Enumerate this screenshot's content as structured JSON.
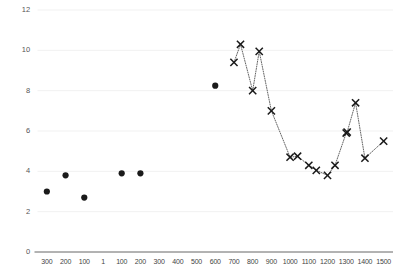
{
  "chart_data": {
    "type": "scatter",
    "title": "",
    "subtitle": "",
    "xlabel": "",
    "ylabel": "",
    "xlim": [
      0,
      19
    ],
    "ylim": [
      0,
      12
    ],
    "grid": true,
    "legend_position": "none",
    "y_ticks": [
      0,
      2,
      4,
      6,
      8,
      10,
      12
    ],
    "y_tick_labels": [
      "0",
      "2",
      "4",
      "6",
      "8",
      "10",
      "12"
    ],
    "x_tick_labels": [
      "300",
      "200",
      "100",
      "1",
      "100",
      "200",
      "300",
      "400",
      "500",
      "600",
      "700",
      "800",
      "900",
      "1000",
      "1100",
      "1200",
      "1300",
      "1400",
      "1500"
    ],
    "series": [
      {
        "name": "isolated-points",
        "marker": "filled-circle",
        "color": "#1a1a1a",
        "connected": false,
        "points": [
          {
            "x_label": "300",
            "x_index": 0,
            "value": 3.0
          },
          {
            "x_label": "200",
            "x_index": 1,
            "value": 3.8
          },
          {
            "x_label": "100",
            "x_index": 2,
            "value": 2.7
          },
          {
            "x_label": "100",
            "x_index": 4,
            "value": 3.9
          },
          {
            "x_label": "200",
            "x_index": 5,
            "value": 3.9
          },
          {
            "x_label": "600",
            "x_index": 9,
            "value": 8.25
          }
        ]
      },
      {
        "name": "connected-series",
        "marker": "x",
        "color": "#1a1a1a",
        "connected": true,
        "line_style": "dotted",
        "points": [
          {
            "x_label": "700",
            "x_index": 10,
            "value": 9.4
          },
          {
            "x_label": "700",
            "x_index": 10.35,
            "value": 10.3
          },
          {
            "x_label": "800",
            "x_index": 11,
            "value": 8.0
          },
          {
            "x_label": "800",
            "x_index": 11.35,
            "value": 9.95
          },
          {
            "x_label": "900",
            "x_index": 12,
            "value": 7.0
          },
          {
            "x_label": "1000",
            "x_index": 13,
            "value": 4.7
          },
          {
            "x_label": "1000",
            "x_index": 13.4,
            "value": 4.75
          },
          {
            "x_label": "1100",
            "x_index": 14,
            "value": 4.3
          },
          {
            "x_label": "1100",
            "x_index": 14.4,
            "value": 4.05
          },
          {
            "x_label": "1200",
            "x_index": 15,
            "value": 3.8
          },
          {
            "x_label": "1200",
            "x_index": 15.4,
            "value": 4.3
          },
          {
            "x_label": "1300",
            "x_index": 16,
            "value": 5.9
          },
          {
            "x_label": "1300",
            "x_index": 16.05,
            "value": 5.95
          },
          {
            "x_label": "1300",
            "x_index": 16.5,
            "value": 7.4
          },
          {
            "x_label": "1400",
            "x_index": 17,
            "value": 4.65
          },
          {
            "x_label": "1500",
            "x_index": 18,
            "value": 5.5
          }
        ]
      }
    ]
  }
}
